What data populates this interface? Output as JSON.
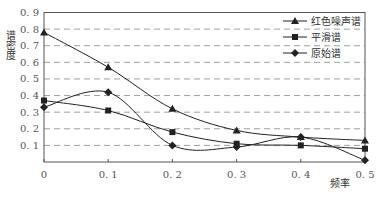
{
  "chart_data": {
    "type": "line",
    "title": "",
    "xlabel": "频率",
    "ylabel": "谱密度",
    "x": [
      0,
      0.1,
      0.2,
      0.3,
      0.4,
      0.5
    ],
    "x_tick_labels": [
      "0",
      "0.1",
      "0.2",
      "0.3",
      "0.4",
      "0.5"
    ],
    "y_tick_labels": [
      "0.1",
      "0.2",
      "0.3",
      "0.4",
      "0.5",
      "0.6",
      "0.7",
      "0.8",
      "0.9"
    ],
    "xlim": [
      0,
      0.5
    ],
    "ylim": [
      0,
      0.9
    ],
    "grid": "horizontal dashed",
    "legend_position": "upper right",
    "series": [
      {
        "name": "红色噪声谱",
        "marker": "triangle",
        "values": [
          0.78,
          0.57,
          0.32,
          0.19,
          0.15,
          0.13
        ]
      },
      {
        "name": "平滑谱",
        "marker": "square",
        "values": [
          0.37,
          0.31,
          0.18,
          0.11,
          0.1,
          0.08
        ]
      },
      {
        "name": "原始谱",
        "marker": "diamond",
        "values": [
          0.33,
          0.42,
          0.1,
          0.09,
          0.15,
          0.01
        ]
      }
    ]
  },
  "colors": {
    "line": "#222222",
    "grid": "#888888",
    "axis": "#555555"
  }
}
